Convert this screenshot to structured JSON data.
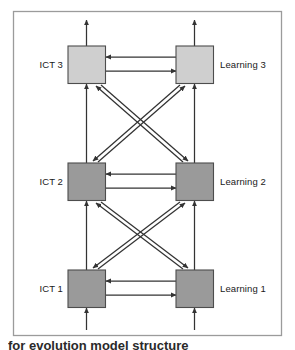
{
  "figure": {
    "type": "block-flow-diagram",
    "caption": "for evolution model structure",
    "frame": {
      "border_color": "#9b9b9b",
      "background": "#ffffff"
    },
    "palette": {
      "node_fill_light": "#cfcfcf",
      "node_fill_dark": "#9a9a9a",
      "node_stroke": "#4d4d4d",
      "arrow_color": "#333333",
      "text_color": "#1a1a1a"
    },
    "columns": [
      {
        "id": "ict",
        "label_prefix": "ICT"
      },
      {
        "id": "learning",
        "label_prefix": "Learning"
      }
    ],
    "nodes": [
      {
        "id": "ict3",
        "label": "ICT 3",
        "column": "ict",
        "level": 3,
        "fill": "#cfcfcf"
      },
      {
        "id": "learning3",
        "label": "Learning 3",
        "column": "learning",
        "level": 3,
        "fill": "#cfcfcf"
      },
      {
        "id": "ict2",
        "label": "ICT 2",
        "column": "ict",
        "level": 2,
        "fill": "#9a9a9a"
      },
      {
        "id": "learning2",
        "label": "Learning 2",
        "column": "learning",
        "level": 2,
        "fill": "#9a9a9a"
      },
      {
        "id": "ict1",
        "label": "ICT 1",
        "column": "ict",
        "level": 1,
        "fill": "#9a9a9a"
      },
      {
        "id": "learning1",
        "label": "Learning 1",
        "column": "learning",
        "level": 1,
        "fill": "#9a9a9a"
      }
    ],
    "edges": [
      {
        "from": "external-below",
        "to": "ict1",
        "kind": "vertical-in"
      },
      {
        "from": "external-below",
        "to": "learning1",
        "kind": "vertical-in"
      },
      {
        "from": "ict3",
        "to": "external-above",
        "kind": "vertical-out"
      },
      {
        "from": "learning3",
        "to": "external-above",
        "kind": "vertical-out"
      },
      {
        "from": "ict1",
        "to": "ict2",
        "kind": "vertical-up"
      },
      {
        "from": "ict2",
        "to": "ict3",
        "kind": "vertical-up"
      },
      {
        "from": "learning1",
        "to": "learning2",
        "kind": "vertical-up"
      },
      {
        "from": "learning2",
        "to": "learning3",
        "kind": "vertical-up"
      },
      {
        "from": "learning3",
        "to": "ict3",
        "kind": "horizontal-left"
      },
      {
        "from": "ict3",
        "to": "learning3",
        "kind": "horizontal-right"
      },
      {
        "from": "learning2",
        "to": "ict2",
        "kind": "horizontal-left"
      },
      {
        "from": "ict2",
        "to": "learning2",
        "kind": "horizontal-right"
      },
      {
        "from": "learning1",
        "to": "ict1",
        "kind": "horizontal-left"
      },
      {
        "from": "ict1",
        "to": "learning1",
        "kind": "horizontal-right"
      },
      {
        "from": "ict3",
        "to": "learning2",
        "kind": "diagonal"
      },
      {
        "from": "learning2",
        "to": "ict3",
        "kind": "diagonal"
      },
      {
        "from": "learning3",
        "to": "ict2",
        "kind": "diagonal"
      },
      {
        "from": "ict2",
        "to": "learning3",
        "kind": "diagonal"
      },
      {
        "from": "ict2",
        "to": "learning1",
        "kind": "diagonal"
      },
      {
        "from": "learning1",
        "to": "ict2",
        "kind": "diagonal"
      },
      {
        "from": "learning2",
        "to": "ict1",
        "kind": "diagonal"
      },
      {
        "from": "ict1",
        "to": "learning2",
        "kind": "diagonal"
      }
    ]
  }
}
